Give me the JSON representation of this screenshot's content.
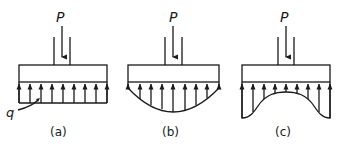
{
  "diagram": {
    "load_label": "P",
    "pressure_label": "q",
    "stroke_color": "#1a1a1a",
    "background": "#ffffff",
    "panels": [
      {
        "id": "a",
        "caption": "(a)",
        "distribution": "uniform"
      },
      {
        "id": "b",
        "caption": "(b)",
        "distribution": "parabolic-center-max"
      },
      {
        "id": "c",
        "caption": "(c)",
        "distribution": "edge-max"
      }
    ]
  }
}
